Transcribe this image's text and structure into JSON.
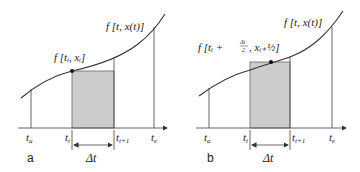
{
  "diagram": {
    "colors": {
      "background": "#ffffff",
      "rect_fill": "#cccccc",
      "line": "#555555",
      "curve": "#333333",
      "dot": "#111111"
    },
    "panels": [
      {
        "id": "a",
        "panel_label": "a",
        "curve_label": "f [t, x(t)]",
        "point_label": "f [tᵢ, xᵢ]",
        "ticks": {
          "ta": "a",
          "ti": "i",
          "ti1": "i+1",
          "te": "e"
        },
        "delta_label": "Δt"
      },
      {
        "id": "b",
        "panel_label": "b",
        "curve_label": "f [t, x(t)]",
        "point_label_prefix": "f [tᵢ +",
        "point_frac_num": "Δt",
        "point_frac_den": "2",
        "point_label_x": ", xᵢ₊½]",
        "ticks": {
          "ta": "a",
          "ti": "i",
          "ti1": "i+1",
          "te": "e"
        },
        "delta_label": "Δt"
      }
    ]
  }
}
